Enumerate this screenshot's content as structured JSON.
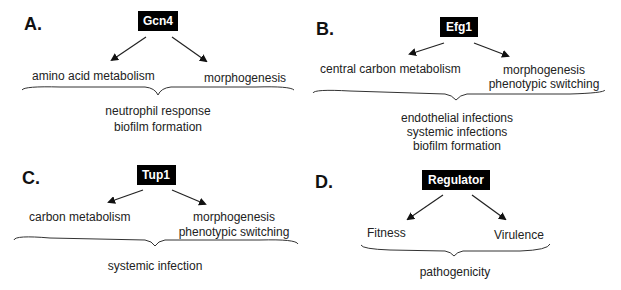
{
  "panels": [
    {
      "label": "A.",
      "regulator": "Gcn4",
      "left_outcome": [
        "amino acid metabolism"
      ],
      "right_outcome": [
        "morphogenesis"
      ],
      "result": [
        "neutrophil response",
        "biofilm formation"
      ]
    },
    {
      "label": "B.",
      "regulator": "Efg1",
      "left_outcome": [
        "central carbon metabolism"
      ],
      "right_outcome": [
        "morphogenesis",
        "phenotypic switching"
      ],
      "result": [
        "endothelial infections",
        "systemic infections",
        "biofilm formation"
      ]
    },
    {
      "label": "C.",
      "regulator": "Tup1",
      "left_outcome": [
        "carbon metabolism"
      ],
      "right_outcome": [
        "morphogenesis",
        "phenotypic switching"
      ],
      "result": [
        "systemic infection"
      ]
    },
    {
      "label": "D.",
      "regulator": "Regulator",
      "left_outcome": [
        "Fitness"
      ],
      "right_outcome": [
        "Virulence"
      ],
      "result": [
        "pathogenicity"
      ]
    }
  ],
  "colors": {
    "box_fill": "#000000",
    "box_text": "#ffffff",
    "text": "#222222"
  }
}
